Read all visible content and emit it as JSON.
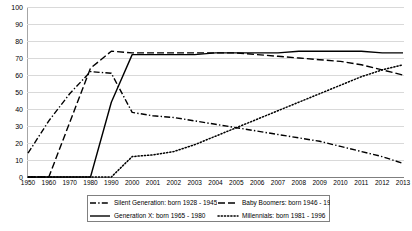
{
  "chart_data": {
    "type": "line",
    "title": "",
    "xlabel": "",
    "ylabel": "",
    "ylim": [
      0,
      100
    ],
    "ytick_step": 10,
    "grid": true,
    "legend_position": "bottom",
    "yticks": [
      "100",
      "90",
      "80",
      "70",
      "60",
      "50",
      "40",
      "30",
      "20",
      "10",
      "0"
    ],
    "categories": [
      "1950",
      "1960",
      "1970",
      "1980",
      "1990",
      "2000",
      "2001",
      "2002",
      "2003",
      "2004",
      "2005",
      "2006",
      "2007",
      "2008",
      "2009",
      "2010",
      "2011",
      "2012",
      "2013"
    ],
    "series": [
      {
        "name": "Silent Generation: born 1928 - 1945",
        "style": "dash-dot",
        "color": "#000000",
        "values": [
          14,
          33,
          49,
          62,
          61,
          38,
          36,
          35,
          33,
          31,
          29,
          27,
          25,
          23,
          21,
          18,
          15,
          12,
          8
        ]
      },
      {
        "name": "Baby Boomers: born 1946 - 1964",
        "style": "long-dash",
        "color": "#000000",
        "values": [
          0,
          0,
          32,
          64,
          74,
          73,
          73,
          73,
          73,
          73,
          73,
          72,
          71,
          70,
          69,
          68,
          66,
          63,
          60
        ]
      },
      {
        "name": "Generation X: born 1965 - 1980",
        "style": "solid",
        "color": "#000000",
        "values": [
          0,
          0,
          0,
          0,
          44,
          72,
          72,
          72,
          72,
          73,
          73,
          73,
          73,
          74,
          74,
          74,
          74,
          73,
          73
        ]
      },
      {
        "name": "Millennials: born 1981 - 1996",
        "style": "dotted",
        "color": "#000000",
        "values": [
          0,
          0,
          0,
          0,
          0,
          12,
          13,
          15,
          19,
          24,
          29,
          34,
          39,
          44,
          49,
          54,
          59,
          63,
          66
        ]
      }
    ]
  },
  "legend": {
    "items": [
      {
        "label": "Silent Generation: born 1928 - 1945",
        "style": "dash-dot"
      },
      {
        "label": "Baby Boomers: born 1946 - 1964",
        "style": "long-dash"
      },
      {
        "label": "Generation X: born 1965 - 1980",
        "style": "solid"
      },
      {
        "label": "Millennials: born 1981 - 1996",
        "style": "dotted"
      }
    ]
  }
}
